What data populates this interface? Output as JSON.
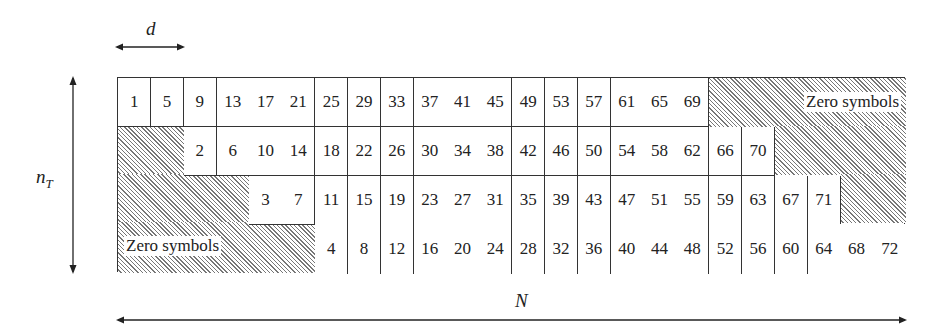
{
  "labels": {
    "d": "d",
    "n_T_main": "n",
    "n_T_sub": "T",
    "N": "N",
    "zero_top": "Zero symbols",
    "zero_bottom": "Zero symbols"
  },
  "grid": {
    "rows": 4,
    "cols": 24,
    "row_offsets": [
      0,
      2,
      4,
      6
    ],
    "cells_per_row": 18,
    "values": [
      [
        "1",
        "5",
        "9",
        "13",
        "17",
        "21",
        "25",
        "29",
        "33",
        "37",
        "41",
        "45",
        "49",
        "53",
        "57",
        "61",
        "65",
        "69"
      ],
      [
        "2",
        "6",
        "10",
        "14",
        "18",
        "22",
        "26",
        "30",
        "34",
        "38",
        "42",
        "46",
        "50",
        "54",
        "58",
        "62",
        "66",
        "70"
      ],
      [
        "3",
        "7",
        "11",
        "15",
        "19",
        "23",
        "27",
        "31",
        "35",
        "39",
        "43",
        "47",
        "51",
        "55",
        "59",
        "63",
        "67",
        "71"
      ],
      [
        "4",
        "8",
        "12",
        "16",
        "20",
        "24",
        "28",
        "32",
        "36",
        "40",
        "44",
        "48",
        "52",
        "56",
        "60",
        "64",
        "68",
        "72"
      ]
    ]
  }
}
